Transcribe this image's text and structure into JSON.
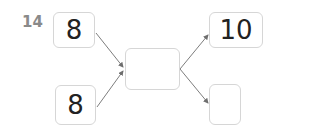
{
  "problem": {
    "number": "14",
    "inputs": [
      {
        "id": "input-top",
        "value": "8"
      },
      {
        "id": "input-bottom",
        "value": "8"
      }
    ],
    "middle": {
      "value": ""
    },
    "outputs": [
      {
        "id": "output-top",
        "value": "10"
      },
      {
        "id": "output-bottom",
        "value": ""
      }
    ]
  },
  "colors": {
    "box_border": "#d6d6d6",
    "arrow": "#6e6e6e",
    "number": "#8a8a8a",
    "text": "#222222"
  }
}
